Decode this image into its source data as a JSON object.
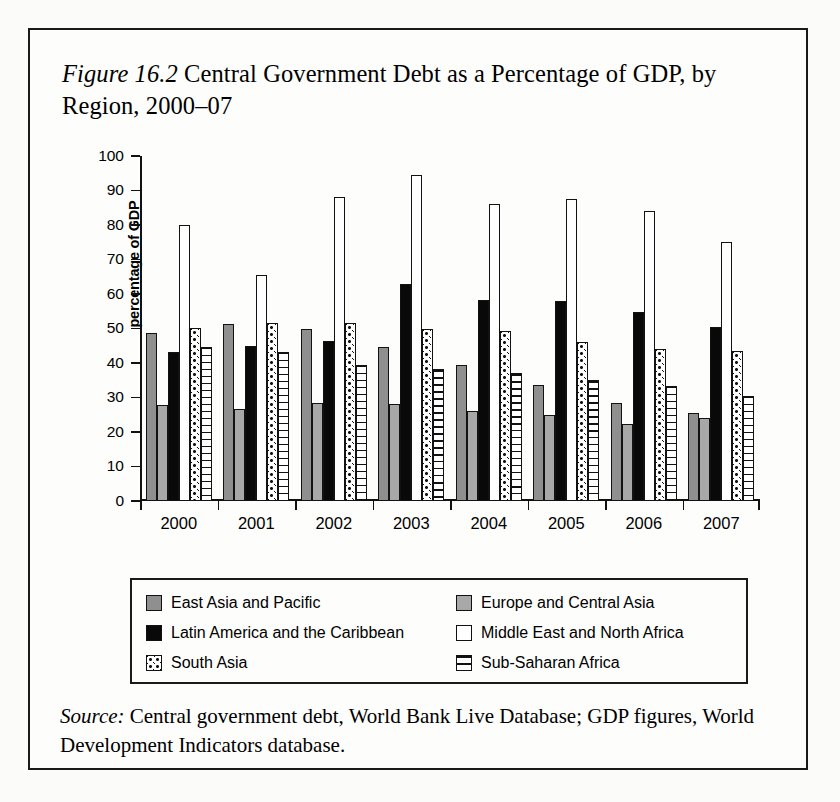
{
  "figure": {
    "label": "Figure 16.2",
    "title": "Central Government Debt as a Percentage of GDP, by Region, 2000–07",
    "title_full": "Figure 16.2 Central Government Debt as a Percentage of GDP, by Region, 2000–07"
  },
  "source": {
    "label": "Source:",
    "text": "Central government debt, World Bank Live Database; GDP figures, World Development Indicators database."
  },
  "legend": {
    "items": [
      {
        "key": "eap",
        "label": "East Asia and Pacific",
        "swatch": "dark-gray-square",
        "color": "#8f8f8f"
      },
      {
        "key": "eca",
        "label": "Europe and Central Asia",
        "swatch": "light-gray-square",
        "color": "#a8a8a8"
      },
      {
        "key": "lac",
        "label": "Latin America and the Caribbean",
        "swatch": "black-square",
        "color": "#090909"
      },
      {
        "key": "mena",
        "label": "Middle East and North Africa",
        "swatch": "white-square",
        "color": "#ffffff"
      },
      {
        "key": "sa",
        "label": "South Asia",
        "swatch": "dotted-square",
        "color": "#ffffff"
      },
      {
        "key": "ssa",
        "label": "Sub-Saharan Africa",
        "swatch": "horizontal-striped-square",
        "color": "#ffffff"
      }
    ]
  },
  "chart_data": {
    "type": "bar",
    "title": "Central Government Debt as a Percentage of GDP, by Region, 2000–07",
    "xlabel": "",
    "ylabel": "percentage of GDP",
    "ylim": [
      0,
      100
    ],
    "yticks": [
      0,
      10,
      20,
      30,
      40,
      50,
      60,
      70,
      80,
      90,
      100
    ],
    "ytick_labels": [
      "0",
      "10",
      "20",
      "30",
      "40",
      "50",
      "60",
      "70",
      "80",
      "90",
      "100"
    ],
    "grid": false,
    "legend_position": "below",
    "categories": [
      "2000",
      "2001",
      "2002",
      "2003",
      "2004",
      "2005",
      "2006",
      "2007"
    ],
    "series": [
      {
        "name": "East Asia and Pacific",
        "key": "eap",
        "values": [
          48.8,
          51.3,
          50.0,
          44.7,
          39.4,
          33.5,
          28.5,
          25.5
        ]
      },
      {
        "name": "Europe and Central Asia",
        "key": "eca",
        "values": [
          27.9,
          26.6,
          28.4,
          28.0,
          26.0,
          24.9,
          22.4,
          24.0
        ]
      },
      {
        "name": "Latin America and the Caribbean",
        "key": "lac",
        "values": [
          43.3,
          44.9,
          46.5,
          63.0,
          58.2,
          57.9,
          54.7,
          50.5
        ]
      },
      {
        "name": "Middle East and North Africa",
        "key": "mena",
        "values": [
          80.0,
          65.6,
          88.0,
          94.6,
          86.0,
          87.5,
          84.0,
          75.0
        ]
      },
      {
        "name": "South Asia",
        "key": "sa",
        "values": [
          50.2,
          51.5,
          51.5,
          50.0,
          49.4,
          46.2,
          44.0,
          43.5
        ]
      },
      {
        "name": "Sub-Saharan Africa",
        "key": "ssa",
        "values": [
          44.6,
          43.3,
          39.4,
          38.2,
          37.0,
          35.2,
          33.3,
          30.5
        ]
      }
    ]
  }
}
